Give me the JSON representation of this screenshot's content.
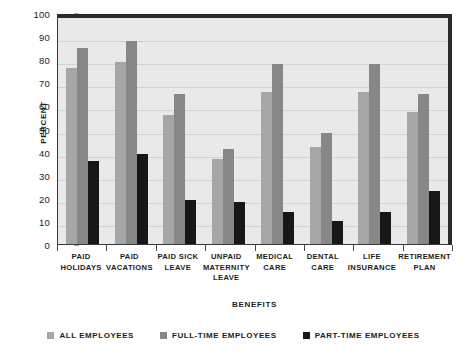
{
  "chart_data": {
    "type": "bar",
    "title": "",
    "xlabel": "Benefits",
    "ylabel": "Percent",
    "ylim": [
      0,
      100
    ],
    "ytick_step": 10,
    "yticks": [
      0,
      10,
      20,
      30,
      40,
      50,
      60,
      70,
      80,
      90,
      100
    ],
    "grid": true,
    "legend_position": "bottom",
    "categories": [
      "Paid Holidays",
      "Paid Vacations",
      "Paid Sick Leave",
      "Unpaid Maternity Leave",
      "Medical Care",
      "Dental Care",
      "Life Insurance",
      "Retirement Plan"
    ],
    "series": [
      {
        "name": "All Employees",
        "color": "#a6a6a6",
        "values": [
          76,
          79,
          56,
          37,
          66,
          42,
          66,
          57
        ]
      },
      {
        "name": "Full-time Employees",
        "color": "#878787",
        "values": [
          85,
          88,
          65,
          41,
          78,
          48,
          78,
          65
        ]
      },
      {
        "name": "Part-time Employees",
        "color": "#171717",
        "values": [
          36,
          39,
          19,
          18,
          14,
          10,
          14,
          23
        ]
      }
    ]
  },
  "axes": {
    "y_title": "Percent",
    "x_title": "Benefits",
    "y_tick_labels": [
      "100",
      "90",
      "80",
      "70",
      "60",
      "50",
      "40",
      "30",
      "20",
      "10",
      "0"
    ],
    "x_tick_labels": [
      "Paid Holidays",
      "Paid Vacations",
      "Paid Sick Leave",
      "Unpaid maternity Leave",
      "Medical Care",
      "Dental Care",
      "Life Insurance",
      "Retirement Plan"
    ]
  },
  "legend": {
    "items": [
      {
        "label": "All Employees",
        "color": "#a6a6a6"
      },
      {
        "label": "Full-time Employees",
        "color": "#878787"
      },
      {
        "label": "Part-time Employees",
        "color": "#171717"
      }
    ]
  },
  "colors": {
    "plot_background": "#e9e9e9",
    "page_background": "#ffffff",
    "frame": "#2b2b2b",
    "gridline": "#d2d2d2",
    "text": "#1c1c1c"
  }
}
